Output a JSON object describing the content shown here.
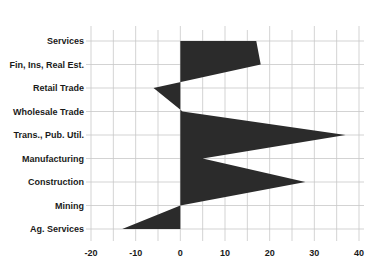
{
  "chart_data": {
    "type": "area",
    "orientation": "horizontal",
    "title": "",
    "xlabel": "",
    "ylabel": "",
    "categories": [
      "Services",
      "Fin, Ins, Real Est.",
      "Retail Trade",
      "Wholesale Trade",
      "Trans., Pub. Util.",
      "Manufacturing",
      "Construction",
      "Mining",
      "Ag. Services"
    ],
    "values": [
      17,
      18,
      -6,
      0.5,
      37,
      5,
      28,
      0,
      -13
    ],
    "xlim": [
      -20,
      40
    ],
    "xticks": [
      -20,
      -10,
      0,
      10,
      20,
      30,
      40
    ],
    "xtick_labels": [
      "-20",
      "-10",
      "0",
      "10",
      "20",
      "30",
      "40"
    ],
    "grid": true,
    "grid_step": 5,
    "legend": null,
    "fill_color": "#2b2b2b",
    "grid_color": "#c8c8c8"
  }
}
